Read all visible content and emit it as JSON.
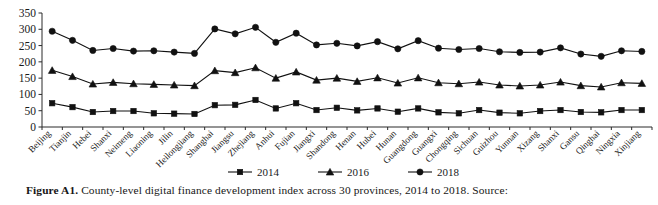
{
  "figure": {
    "caption_label": "Figure A1.",
    "caption_text": "County-level digital finance development index across 30 provinces, 2014 to 2018. Source:"
  },
  "chart_data": {
    "type": "line",
    "title": "",
    "xlabel": "",
    "ylabel": "",
    "ylim": [
      0,
      350
    ],
    "yticks": [
      0,
      50,
      100,
      150,
      200,
      250,
      300,
      350
    ],
    "grid": false,
    "legend_position": "bottom",
    "categories": [
      "Beijing",
      "Tianjin",
      "Hebei",
      "Shanxi",
      "Neimeng",
      "Liaoning",
      "Jilin",
      "Heilongjiang",
      "Shanghai",
      "Jiangsu",
      "Zhejiang",
      "Anhui",
      "Fujian",
      "Jiangxi",
      "Shandong",
      "Henan",
      "Hubei",
      "Hunan",
      "Guangdong",
      "Guangxi",
      "Chongqing",
      "Sichuan",
      "Guizhou",
      "Yunnan",
      "Xizang",
      "Shanxi",
      "Gansu",
      "Qinghai",
      "Ningxia",
      "Xinjiang"
    ],
    "series": [
      {
        "name": "2014",
        "marker": "square",
        "values": [
          73,
          61,
          46,
          49,
          49,
          42,
          41,
          40,
          67,
          68,
          83,
          57,
          73,
          52,
          59,
          51,
          57,
          47,
          57,
          45,
          42,
          52,
          44,
          42,
          49,
          52,
          46,
          45,
          52,
          52
        ]
      },
      {
        "name": "2016",
        "marker": "triangle",
        "values": [
          174,
          155,
          132,
          137,
          133,
          131,
          129,
          127,
          173,
          167,
          182,
          150,
          169,
          144,
          150,
          140,
          151,
          135,
          151,
          136,
          133,
          138,
          129,
          126,
          129,
          138,
          127,
          123,
          136,
          134
        ]
      },
      {
        "name": "2018",
        "marker": "circle",
        "values": [
          294,
          266,
          235,
          241,
          233,
          234,
          230,
          226,
          301,
          286,
          306,
          260,
          288,
          252,
          257,
          249,
          262,
          240,
          265,
          242,
          238,
          241,
          231,
          229,
          230,
          243,
          224,
          217,
          234,
          232
        ]
      }
    ]
  },
  "legend": {
    "entries": [
      {
        "label": "2014",
        "marker": "square"
      },
      {
        "label": "2016",
        "marker": "triangle"
      },
      {
        "label": "2018",
        "marker": "circle"
      }
    ]
  }
}
